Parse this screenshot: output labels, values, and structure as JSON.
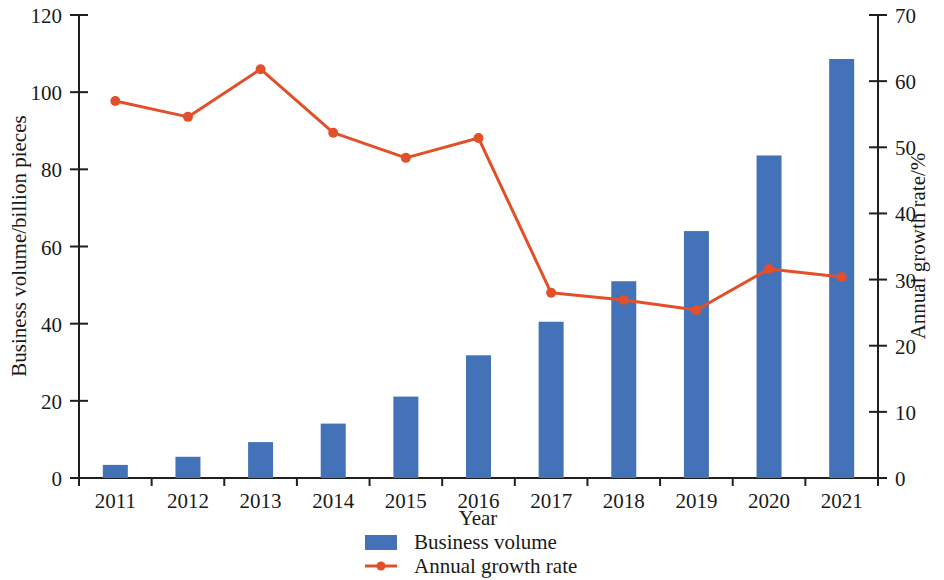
{
  "chart_data": {
    "type": "bar",
    "title": "",
    "subtitle": "",
    "xlabel": "Year",
    "ylabel": "Business volume/billion pieces",
    "y2label": "Annual growth rate/%",
    "categories": [
      "2011",
      "2012",
      "2013",
      "2014",
      "2015",
      "2016",
      "2017",
      "2018",
      "2019",
      "2020",
      "2021"
    ],
    "series": [
      {
        "name": "Business volume",
        "type": "bar",
        "axis": "left",
        "unit": "billion pieces",
        "color": "#4472b8",
        "values": [
          3.4,
          5.5,
          9.3,
          14.1,
          21.1,
          31.8,
          40.5,
          51.0,
          64.0,
          83.6,
          108.6
        ]
      },
      {
        "name": "Annual growth rate",
        "type": "line",
        "axis": "right",
        "unit": "%",
        "color": "#e2502a",
        "values": [
          57.0,
          54.6,
          61.8,
          52.2,
          48.4,
          51.4,
          28.0,
          26.9,
          25.4,
          31.6,
          30.4
        ]
      }
    ],
    "ylim": [
      0,
      120
    ],
    "yticks": [
      0,
      20,
      40,
      60,
      80,
      100,
      120
    ],
    "y2lim": [
      0,
      70
    ],
    "y2ticks": [
      0,
      10,
      20,
      30,
      40,
      50,
      60,
      70
    ],
    "grid": false,
    "legend_position": "bottom"
  },
  "legend": {
    "items": [
      {
        "label": "Business volume",
        "marker": "square-swatch",
        "color": "#4472b8"
      },
      {
        "label": "Annual growth rate",
        "marker": "line-with-dot",
        "color": "#e2502a"
      }
    ]
  }
}
